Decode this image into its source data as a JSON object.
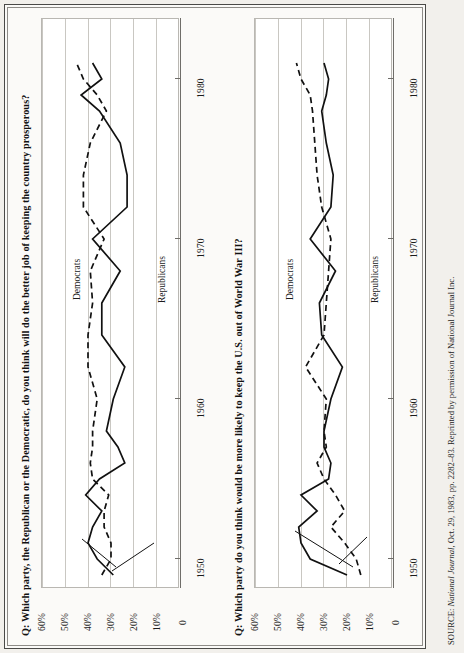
{
  "page": {
    "orientation": "rotated-90-ccw",
    "background": "#fbfaf8",
    "ink": "#111111"
  },
  "source_note": {
    "prefix": "SOURCE:",
    "italic_part": "National Journal,",
    "rest": " Oct. 29, 1983, pp. 2282–83. Reprinted by permission of National Journal Inc."
  },
  "axis": {
    "y_ticks": [
      "60%",
      "50%",
      "40%",
      "30%",
      "20%",
      "10%",
      "0"
    ],
    "x_ticks": [
      "1950",
      "1960",
      "1970",
      "1980"
    ],
    "ylim": [
      0,
      60
    ],
    "xlim": [
      1946,
      1984
    ],
    "grid": "vertical-only"
  },
  "series_labels": {
    "democrats": "Democrats",
    "republicans": "Republicans"
  },
  "colors": {
    "democrats_line": "#111111",
    "republicans_line": "#111111",
    "grid": "#c9c7c2",
    "frame": "#b9b7b2",
    "axis": "#6f6d69"
  },
  "chart_data": [
    {
      "type": "line",
      "title": "Q: Which party, the Republican or the Democratic, do you think will do the better job of keeping the country prosperous?",
      "xlabel": "",
      "ylabel": "",
      "ylim": [
        0,
        60
      ],
      "xlim": [
        1946,
        1984
      ],
      "grid": true,
      "legend": "inline-annotation",
      "x": [
        1951,
        1952,
        1953,
        1954,
        1955,
        1956,
        1957,
        1958,
        1959,
        1960,
        1962,
        1964,
        1966,
        1968,
        1970,
        1972,
        1974,
        1976,
        1978,
        1980,
        1981,
        1982,
        1983
      ],
      "series": [
        {
          "name": "Democrats",
          "style": "dashed",
          "values": [
            34,
            30,
            30,
            33,
            33,
            31,
            38,
            39,
            38,
            38,
            36,
            40,
            40,
            38,
            39,
            33,
            42,
            42,
            39,
            32,
            36,
            42,
            45
          ]
        },
        {
          "name": "Republicans",
          "style": "solid",
          "values": [
            29,
            36,
            40,
            38,
            34,
            41,
            35,
            24,
            27,
            32,
            29,
            24,
            34,
            34,
            26,
            38,
            23,
            23,
            26,
            35,
            43,
            34,
            38
          ]
        }
      ]
    },
    {
      "type": "line",
      "title": "Q: Which party do you think would be more likely to keep the U.S. out of World War III?",
      "xlabel": "",
      "ylabel": "",
      "ylim": [
        0,
        60
      ],
      "xlim": [
        1946,
        1984
      ],
      "grid": true,
      "legend": "inline-annotation",
      "x": [
        1951,
        1952,
        1953,
        1954,
        1955,
        1956,
        1957,
        1958,
        1959,
        1960,
        1962,
        1964,
        1966,
        1968,
        1970,
        1972,
        1974,
        1976,
        1978,
        1980,
        1981,
        1982,
        1983
      ],
      "series": [
        {
          "name": "Democrats",
          "style": "dashed",
          "values": [
            14,
            16,
            21,
            27,
            21,
            25,
            30,
            33,
            29,
            30,
            29,
            38,
            30,
            29,
            28,
            27,
            31,
            33,
            34,
            35,
            36,
            40,
            42
          ]
        },
        {
          "name": "Republicans",
          "style": "solid",
          "values": [
            20,
            36,
            40,
            41,
            33,
            40,
            28,
            27,
            30,
            30,
            27,
            22,
            31,
            32,
            25,
            36,
            27,
            26,
            29,
            31,
            29,
            28,
            30
          ]
        }
      ]
    }
  ]
}
